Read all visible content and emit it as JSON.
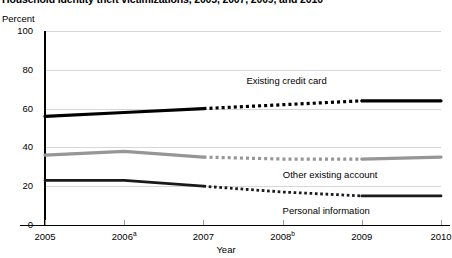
{
  "chart_data": {
    "type": "line",
    "title": "Household identity theft victimizations, 2005, 2007, 2009, and 2010",
    "xlabel": "Year",
    "ylabel": "Percent",
    "ylim": [
      0,
      100
    ],
    "xlim": [
      2005,
      2010
    ],
    "yticks": [
      "0",
      "20",
      "40",
      "60",
      "80",
      "100"
    ],
    "ytick_values": [
      0,
      20,
      40,
      60,
      80,
      100
    ],
    "xticks": [
      "2005",
      "2006",
      "2007",
      "2008",
      "2009",
      "2010"
    ],
    "xtick_superscripts": [
      "",
      "a",
      "",
      "b",
      "",
      ""
    ],
    "grid": "horizontal",
    "legend_position": "inline-annotation",
    "x": [
      2005,
      2006,
      2007,
      2008,
      2009,
      2010
    ],
    "series": [
      {
        "name": "Existing credit card",
        "values": [
          56,
          58,
          60,
          62,
          64,
          64
        ],
        "color": "#000000",
        "width": 3.2,
        "dashed_from": 2007,
        "dashed_to": 2009,
        "label_x": 2008.05,
        "label_y": 74
      },
      {
        "name": "Other existing account",
        "values": [
          36,
          38,
          35,
          34,
          34,
          35
        ],
        "color": "#969696",
        "width": 3.2,
        "dashed_from": 2007,
        "dashed_to": 2009,
        "label_x": 2008.6,
        "label_y": 26
      },
      {
        "name": "Personal information",
        "values": [
          23,
          23,
          20,
          17,
          15,
          15
        ],
        "color": "#1a1a1a",
        "width": 2.8,
        "dashed_from": 2007,
        "dashed_to": 2009,
        "label_x": 2008.55,
        "label_y": 7
      }
    ]
  }
}
